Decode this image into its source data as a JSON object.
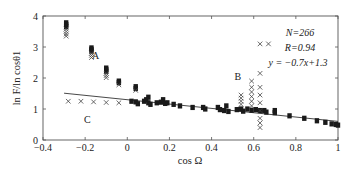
{
  "chart_data": {
    "type": "scatter",
    "title": "",
    "xlabel": "cos Ω",
    "ylabel": "ln F/ln cosθ1",
    "xlim": [
      -0.4,
      1.0
    ],
    "ylim": [
      0,
      4
    ],
    "xticks": [
      -0.4,
      -0.2,
      0,
      0.2,
      0.4,
      0.6,
      0.8,
      1
    ],
    "xtick_labels": [
      "−0.4",
      "−0.2",
      "0",
      "0.2",
      "0.4",
      "0.6",
      "0.8",
      "1"
    ],
    "yticks": [
      0,
      1,
      2,
      3,
      4
    ],
    "ytick_labels": [
      "0",
      "1",
      "2",
      "3",
      "4"
    ],
    "grid": false,
    "annotations": {
      "n": "N=266",
      "r": "R=0.94",
      "fit": "y = −0.7x+1.3"
    },
    "group_labels": [
      {
        "label": "A",
        "x": -0.15,
        "y": 2.6
      },
      {
        "label": "B",
        "x": 0.525,
        "y": 1.95
      },
      {
        "label": "C",
        "x": -0.19,
        "y": 0.55
      }
    ],
    "fit_line": {
      "slope": -0.7,
      "intercept": 1.3,
      "x_range": [
        -0.3,
        1.0
      ]
    },
    "series": [
      {
        "name": "filled markers (fit data)",
        "marker": "filled-square",
        "points": [
          [
            -0.29,
            3.78
          ],
          [
            -0.29,
            3.72
          ],
          [
            -0.29,
            3.66
          ],
          [
            -0.17,
            2.97
          ],
          [
            -0.17,
            2.92
          ],
          [
            -0.17,
            2.87
          ],
          [
            -0.1,
            2.32
          ],
          [
            -0.1,
            2.27
          ],
          [
            -0.1,
            2.22
          ],
          [
            -0.04,
            1.9
          ],
          [
            -0.04,
            1.85
          ],
          [
            0.04,
            1.72
          ],
          [
            0.04,
            1.66
          ],
          [
            0.02,
            1.25
          ],
          [
            0.04,
            1.23
          ],
          [
            0.05,
            1.17
          ],
          [
            0.08,
            1.25
          ],
          [
            0.09,
            1.3
          ],
          [
            0.1,
            1.38
          ],
          [
            0.1,
            1.2
          ],
          [
            0.11,
            1.15
          ],
          [
            0.14,
            1.2
          ],
          [
            0.16,
            1.22
          ],
          [
            0.17,
            1.3
          ],
          [
            0.18,
            1.18
          ],
          [
            0.19,
            1.2
          ],
          [
            0.22,
            1.15
          ],
          [
            0.25,
            1.1
          ],
          [
            0.31,
            1.05
          ],
          [
            0.36,
            1.05
          ],
          [
            0.37,
            1.0
          ],
          [
            0.43,
            1.05
          ],
          [
            0.44,
            0.98
          ],
          [
            0.46,
            0.95
          ],
          [
            0.47,
            1.1
          ],
          [
            0.48,
            0.92
          ],
          [
            0.52,
            0.98
          ],
          [
            0.54,
            1.0
          ],
          [
            0.55,
            0.93
          ],
          [
            0.57,
            1.0
          ],
          [
            0.59,
            0.96
          ],
          [
            0.61,
            0.98
          ],
          [
            0.63,
            0.95
          ],
          [
            0.65,
            0.95
          ],
          [
            0.66,
            0.9
          ],
          [
            0.7,
            0.95
          ],
          [
            0.7,
            0.88
          ],
          [
            0.77,
            0.78
          ],
          [
            0.84,
            0.7
          ],
          [
            0.9,
            0.62
          ],
          [
            0.94,
            0.57
          ],
          [
            0.97,
            0.52
          ],
          [
            0.99,
            0.5
          ],
          [
            1.0,
            0.48
          ]
        ]
      },
      {
        "name": "crosses (excluded, groups A/B/C)",
        "marker": "cross",
        "points": [
          [
            -0.29,
            3.58
          ],
          [
            -0.29,
            3.5
          ],
          [
            -0.29,
            3.42
          ],
          [
            -0.29,
            3.35
          ],
          [
            -0.17,
            2.8
          ],
          [
            -0.17,
            2.73
          ],
          [
            -0.17,
            2.66
          ],
          [
            -0.1,
            2.15
          ],
          [
            -0.1,
            2.08
          ],
          [
            -0.1,
            2.01
          ],
          [
            -0.04,
            1.78
          ],
          [
            0.04,
            1.6
          ],
          [
            -0.28,
            1.25
          ],
          [
            -0.22,
            1.25
          ],
          [
            -0.16,
            1.23
          ],
          [
            -0.1,
            1.21
          ],
          [
            -0.04,
            1.2
          ],
          [
            0.54,
            1.45
          ],
          [
            0.54,
            1.35
          ],
          [
            0.54,
            1.25
          ],
          [
            0.54,
            1.15
          ],
          [
            0.59,
            1.9
          ],
          [
            0.59,
            1.7
          ],
          [
            0.59,
            1.55
          ],
          [
            0.59,
            1.4
          ],
          [
            0.59,
            1.25
          ],
          [
            0.59,
            1.1
          ],
          [
            0.63,
            3.1
          ],
          [
            0.63,
            2.15
          ],
          [
            0.63,
            1.7
          ],
          [
            0.63,
            1.45
          ],
          [
            0.63,
            1.2
          ],
          [
            0.63,
            0.95
          ],
          [
            0.63,
            0.7
          ],
          [
            0.63,
            0.55
          ],
          [
            0.63,
            0.4
          ],
          [
            0.67,
            3.1
          ]
        ]
      }
    ]
  }
}
